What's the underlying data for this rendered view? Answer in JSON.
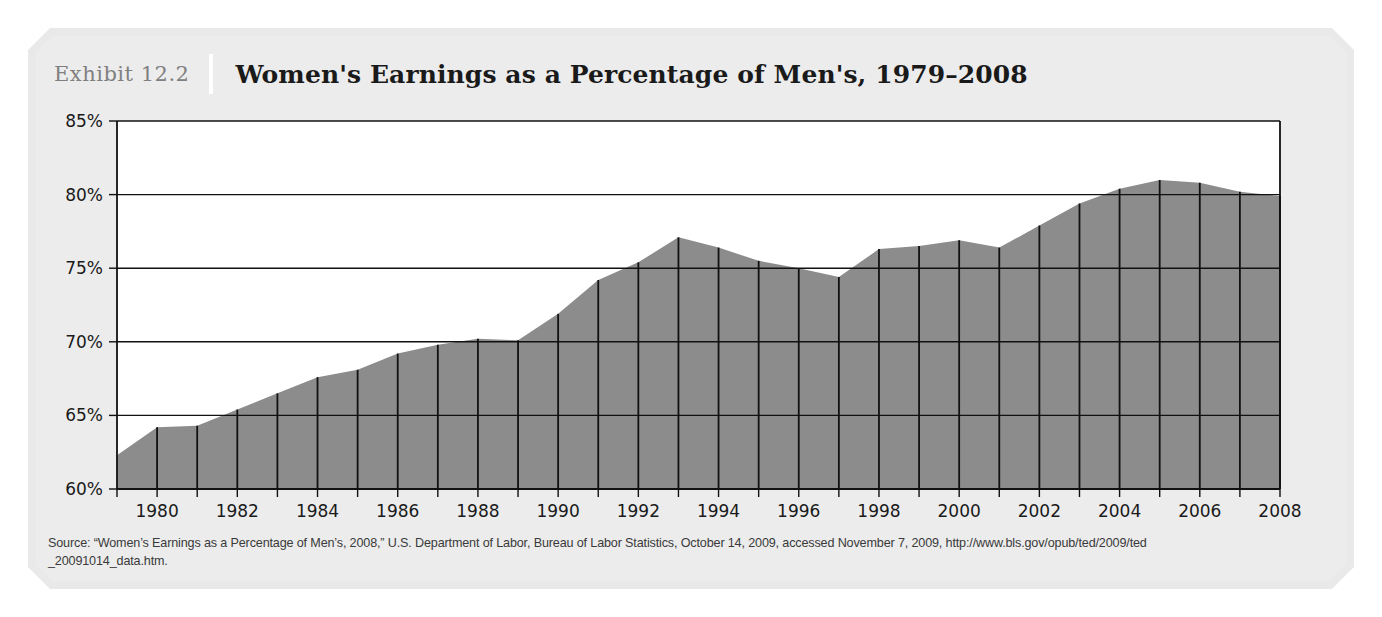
{
  "header": {
    "exhibit_number": "Exhibit 12.2",
    "title": "Women's Earnings as a Percentage of Men's, 1979–2008"
  },
  "source_note_line1": "Source: “Women’s Earnings as a Percentage of Men’s, 2008,” U.S. Department of Labor, Bureau of Labor Statistics, October 14, 2009, accessed November 7, 2009, http://www.bls.gov/opub/ted/2009/ted",
  "source_note_line2": "_20091014_data.htm.",
  "colors": {
    "panel_bg": "#e9e9e9",
    "plot_bg": "#ffffff",
    "area_fill": "#8c8c8c",
    "axis_line": "#111111",
    "separator_line": "#111111",
    "title_text": "#1a1a1a",
    "exhibit_text": "#808080"
  },
  "chart_data": {
    "type": "area",
    "title": "Women's Earnings as a Percentage of Men's, 1979–2008",
    "xlabel": "",
    "ylabel": "",
    "ylim": [
      60,
      85
    ],
    "ytick_step": 5,
    "ytick_labels": [
      "85%",
      "80%",
      "75%",
      "70%",
      "65%",
      "60%"
    ],
    "ytick_values": [
      85,
      80,
      75,
      70,
      65,
      60
    ],
    "xlim": [
      1979,
      2008
    ],
    "xtick_labels": [
      "1980",
      "1982",
      "1984",
      "1986",
      "1988",
      "1990",
      "1992",
      "1994",
      "1996",
      "1998",
      "2000",
      "2002",
      "2004",
      "2006",
      "2008"
    ],
    "xtick_values": [
      1980,
      1982,
      1984,
      1986,
      1988,
      1990,
      1992,
      1994,
      1996,
      1998,
      2000,
      2002,
      2004,
      2006,
      2008
    ],
    "grid": true,
    "legend": null,
    "x": [
      1979,
      1980,
      1981,
      1982,
      1983,
      1984,
      1985,
      1986,
      1987,
      1988,
      1989,
      1990,
      1991,
      1992,
      1993,
      1994,
      1995,
      1996,
      1997,
      1998,
      1999,
      2000,
      2001,
      2002,
      2003,
      2004,
      2005,
      2006,
      2007,
      2008
    ],
    "values": [
      62.3,
      64.2,
      64.3,
      65.4,
      66.5,
      67.6,
      68.1,
      69.2,
      69.8,
      70.2,
      70.1,
      71.9,
      74.2,
      75.4,
      77.1,
      76.4,
      75.5,
      75.0,
      74.4,
      76.3,
      76.5,
      76.9,
      76.4,
      77.9,
      79.4,
      80.4,
      81.0,
      80.8,
      80.2,
      79.9
    ],
    "value_unit": "percent"
  }
}
